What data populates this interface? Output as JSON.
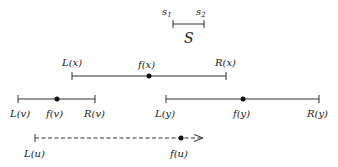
{
  "set_S": {
    "label": "S",
    "start_label": "s",
    "start_sub": "1",
    "end_label": "s",
    "end_sub": "2",
    "x1": 173,
    "x2": 204,
    "y": 24
  },
  "intervals": [
    {
      "id": "x",
      "left_label": "L(x)",
      "center_label": "f(x)",
      "right_label": "R(x)",
      "x1": 72,
      "xf": 149,
      "x2": 226,
      "y": 76,
      "labels_position": "above",
      "style": "solid"
    },
    {
      "id": "v",
      "left_label": "L(v)",
      "center_label": "f(v)",
      "right_label": "R(v)",
      "x1": 18,
      "xf": 57,
      "x2": 95,
      "y": 99,
      "labels_position": "below",
      "style": "solid"
    },
    {
      "id": "y",
      "left_label": "L(y)",
      "center_label": "f(y)",
      "right_label": "R(y)",
      "x1": 166,
      "xf": 243,
      "x2": 319,
      "y": 99,
      "labels_position": "below",
      "style": "solid"
    },
    {
      "id": "u",
      "left_label": "L(u)",
      "center_label": "f(u)",
      "right_label": "",
      "x1": 35,
      "xf": 181,
      "x2": 203,
      "y": 138,
      "labels_position": "below",
      "style": "dashed-arrow"
    }
  ],
  "colors": {
    "line": "#333333",
    "dot": "#111111",
    "text": "#222222",
    "background": "#ffffff"
  }
}
